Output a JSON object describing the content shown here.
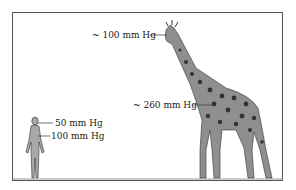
{
  "labels": {
    "giraffe_head": "~ 100 mm Hg",
    "giraffe_heart": "~ 260 mm Hg",
    "human_head": "50 mm Hg",
    "human_heart": "100 mm Hg"
  },
  "colors": {
    "frame": "#555555",
    "fill": "#9a9a9a",
    "spots": "#333333",
    "ground": "#888888"
  }
}
